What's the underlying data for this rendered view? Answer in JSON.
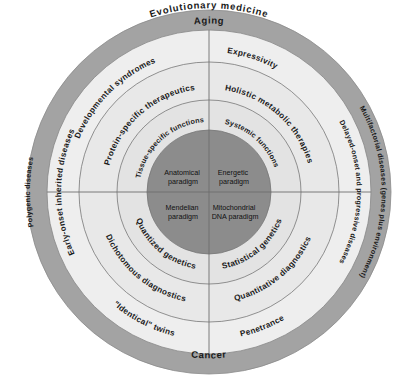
{
  "colors": {
    "outer_ring": "#a3a3a3",
    "ring_light": "#ececec",
    "ring_mid": "#e3e3e3",
    "core": "#8c8c8c",
    "divider": "#707070",
    "text": "#1a1a1a"
  },
  "frame_labels": {
    "top": "Evolutionary medicine",
    "left": "Classical medicine",
    "right": "Mitochondrial medicine"
  },
  "outer_ring": {
    "top": "Aging",
    "bottom": "Cancer",
    "left": "Polygenic diseases",
    "right": "Multifactorial diseases (genes plus environment)"
  },
  "ring1": {
    "top_left": "Developmental syndromes",
    "top_right": "Expressivity",
    "left": "Early-onset inherited diseases",
    "right": "Delayed-onset and progressive diseases",
    "bottom_left": "\"Identical\" twins",
    "bottom_right": "Penetrance"
  },
  "ring2": {
    "top_left": "Protein-specific therapeutics",
    "top_right": "Holistic metabolic therapies",
    "bottom_left": "Dichotomous diagnostics",
    "bottom_right": "Quantitative diagnostics"
  },
  "ring3": {
    "top_left": "Tissue-specific functions",
    "top_right": "Systemic functions",
    "bottom_left": "Quantized genetics",
    "bottom_right": "Statistical genetics"
  },
  "core": {
    "top_left": [
      "Anatomical",
      "paradigm"
    ],
    "top_right": [
      "Energetic",
      "paradigm"
    ],
    "bottom_left": [
      "Mendelian",
      "paradigm"
    ],
    "bottom_right": [
      "Mitochondrial",
      "DNA paradigm"
    ]
  }
}
